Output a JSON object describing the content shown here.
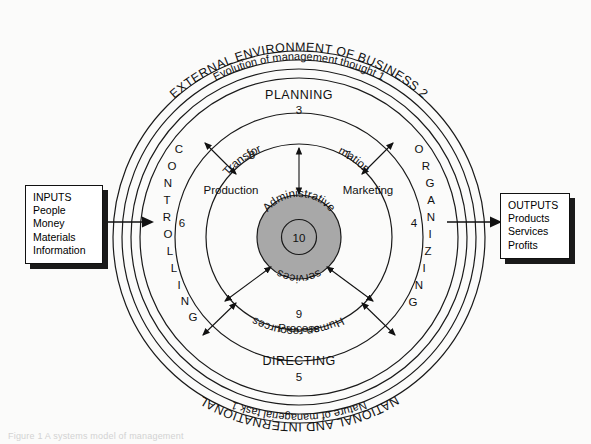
{
  "diagram": {
    "title": "Systems model of management",
    "center": {
      "top_label": "Administrative",
      "bottom_label": "services",
      "number": "10",
      "fill_color": "#a8a8a8"
    },
    "rings": [
      {
        "name": "outer-ring-top",
        "label": "EXTERNAL ENVIRONMENT OF BUSINESS 2"
      },
      {
        "name": "outer-ring-bottom",
        "label": "NATIONAL AND INTERNATIONAL"
      },
      {
        "name": "second-ring-top",
        "label": "Evolution of management thought 1"
      },
      {
        "name": "second-ring-bottom",
        "label": "Nature of managerial task 1"
      }
    ],
    "functions": [
      {
        "name": "planning",
        "label": "PLANNING",
        "number": "3",
        "position": "top"
      },
      {
        "name": "organizing",
        "label": "ORGANIZING",
        "number": "4",
        "position": "right"
      },
      {
        "name": "directing",
        "label": "DIRECTING",
        "number": "5",
        "position": "bottom"
      },
      {
        "name": "controlling",
        "label": "CONTROLLING",
        "number": "6",
        "position": "left"
      }
    ],
    "inner_labels": [
      {
        "name": "transformation",
        "label": "Transfor mation",
        "part1": "Transfor",
        "part2": "mation"
      },
      {
        "name": "marketing",
        "label": "Marketing",
        "number": "7"
      },
      {
        "name": "production",
        "label": "Production",
        "number": "8"
      },
      {
        "name": "human-resources",
        "label": "Human resources",
        "number": "9"
      },
      {
        "name": "process",
        "label": "Process"
      }
    ]
  },
  "inputs": {
    "title": "INPUTS",
    "items": [
      "People",
      "Money",
      "Materials",
      "Information"
    ]
  },
  "outputs": {
    "title": "OUTPUTS",
    "items": [
      "Products",
      "Services",
      "Profits"
    ]
  },
  "footer": {
    "caption": "Figure 1  A systems model of management"
  }
}
